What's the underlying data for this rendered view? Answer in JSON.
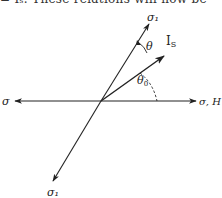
{
  "top_text": "= Iₛ.  These relations will now be",
  "diagram": {
    "labels": {
      "sigma1_top": "σ₁",
      "sigma1_top_sub": "",
      "is_vector": "I",
      "is_vector_sub": "S",
      "theta": "θ",
      "theta0": "θ",
      "theta0_sub": "0",
      "sigma_left": "σ",
      "sigma_right": "σ, H",
      "sigma1_bottom": "σ₁"
    },
    "colors": {
      "line": "#222222",
      "text": "#222222",
      "background": "#ffffff"
    }
  }
}
